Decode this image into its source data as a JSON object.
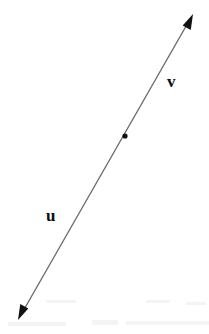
{
  "figure": {
    "background_color": "#ffffff",
    "width": 209,
    "height": 334,
    "line": {
      "name": "double-headed-line",
      "color": "#6b6b6b",
      "stroke_width": 1.2,
      "start": {
        "x": 18,
        "y": 320
      },
      "end": {
        "x": 193,
        "y": 14
      },
      "arrow_start": true,
      "arrow_end": true,
      "arrow_color": "#111111",
      "arrow_length": 15,
      "arrow_half_width": 6
    },
    "point": {
      "name": "marked-point",
      "x": 125,
      "y": 136,
      "radius": 2.6,
      "color": "#111111"
    },
    "labels": [
      {
        "id": "u",
        "text": "u",
        "x": 46,
        "y": 207,
        "color": "#0d0d0d",
        "bold": true,
        "side": "left-of-line"
      },
      {
        "id": "v",
        "text": "v",
        "x": 167,
        "y": 73,
        "color": "#0d0d0d",
        "bold": true,
        "side": "right-of-line"
      }
    ],
    "scan_artifacts": [
      {
        "x": 8,
        "y": 322,
        "w": 58,
        "h": 4
      },
      {
        "x": 92,
        "y": 320,
        "w": 26,
        "h": 5
      },
      {
        "x": 126,
        "y": 321,
        "w": 88,
        "h": 4
      },
      {
        "x": 46,
        "y": 300,
        "w": 30,
        "h": 3
      },
      {
        "x": 146,
        "y": 300,
        "w": 24,
        "h": 3
      },
      {
        "x": 186,
        "y": 302,
        "w": 20,
        "h": 3
      }
    ]
  }
}
